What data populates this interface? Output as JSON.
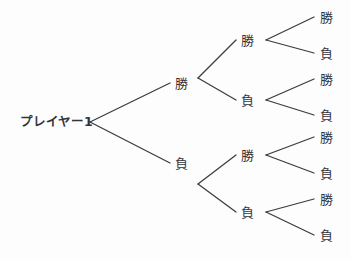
{
  "diagram": {
    "title": "プレイヤー1 勝敗ツリー",
    "type": "binary-outcome-tree",
    "background_color": "#fdfdfd",
    "line_color": "#3a3a42",
    "text_color": "#33333a",
    "root": {
      "label": "プレイヤー1",
      "x": 20,
      "y": 122
    },
    "level1": [
      {
        "label": "勝",
        "x": 175,
        "y": 83
      },
      {
        "label": "負",
        "x": 175,
        "y": 163
      }
    ],
    "level2": [
      {
        "label": "勝",
        "x": 241,
        "y": 40
      },
      {
        "label": "負",
        "x": 241,
        "y": 100
      },
      {
        "label": "勝",
        "x": 241,
        "y": 155
      },
      {
        "label": "負",
        "x": 241,
        "y": 212
      }
    ],
    "level3": [
      {
        "label": "勝",
        "x": 320,
        "y": 17
      },
      {
        "label": "負",
        "x": 320,
        "y": 53
      },
      {
        "label": "勝",
        "x": 320,
        "y": 79
      },
      {
        "label": "負",
        "x": 320,
        "y": 115
      },
      {
        "label": "勝",
        "x": 320,
        "y": 137
      },
      {
        "label": "負",
        "x": 320,
        "y": 173
      },
      {
        "label": "勝",
        "x": 320,
        "y": 199
      },
      {
        "label": "負",
        "x": 320,
        "y": 235
      }
    ],
    "edges": [
      {
        "name": "root-to-win",
        "x1": 90,
        "y1": 122,
        "x2": 170,
        "y2": 83
      },
      {
        "name": "root-to-lose",
        "x1": 90,
        "y1": 122,
        "x2": 170,
        "y2": 163
      },
      {
        "name": "w-to-ww",
        "x1": 198,
        "y1": 78,
        "x2": 236,
        "y2": 40
      },
      {
        "name": "w-to-wl",
        "x1": 198,
        "y1": 78,
        "x2": 236,
        "y2": 100
      },
      {
        "name": "l-to-lw",
        "x1": 198,
        "y1": 184,
        "x2": 236,
        "y2": 155
      },
      {
        "name": "l-to-ll",
        "x1": 198,
        "y1": 184,
        "x2": 236,
        "y2": 212
      },
      {
        "name": "ww-to-wwwin",
        "x1": 266,
        "y1": 40,
        "x2": 314,
        "y2": 17
      },
      {
        "name": "ww-to-wwlose",
        "x1": 266,
        "y1": 40,
        "x2": 314,
        "y2": 53
      },
      {
        "name": "wl-to-wlwin",
        "x1": 266,
        "y1": 100,
        "x2": 314,
        "y2": 79
      },
      {
        "name": "wl-to-wllose",
        "x1": 266,
        "y1": 100,
        "x2": 314,
        "y2": 115
      },
      {
        "name": "lw-to-lwwin",
        "x1": 266,
        "y1": 155,
        "x2": 314,
        "y2": 137
      },
      {
        "name": "lw-to-lwlose",
        "x1": 266,
        "y1": 155,
        "x2": 314,
        "y2": 173
      },
      {
        "name": "ll-to-llwin",
        "x1": 266,
        "y1": 212,
        "x2": 314,
        "y2": 199
      },
      {
        "name": "ll-to-lllose",
        "x1": 266,
        "y1": 212,
        "x2": 314,
        "y2": 235
      }
    ]
  }
}
